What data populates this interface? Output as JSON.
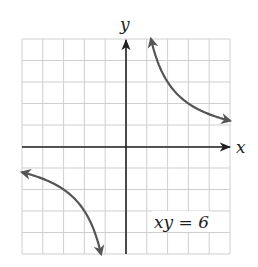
{
  "figure": {
    "equation_label": "xy = 6",
    "x_axis_label": "x",
    "y_axis_label": "y"
  },
  "grid": {
    "x_min": -5,
    "x_max": 5,
    "y_min": -5,
    "y_max": 5,
    "step": 1
  },
  "colors": {
    "grid": "#cfcfcf",
    "axes": "#222222",
    "curve": "#555555",
    "background": "#ffffff"
  },
  "chart_data": {
    "type": "line",
    "title": "",
    "equation": "xy = 6",
    "xlabel": "x",
    "ylabel": "y",
    "xlim": [
      -5,
      5
    ],
    "ylim": [
      -5,
      5
    ],
    "grid": true,
    "series": [
      {
        "name": "upper-branch",
        "x": [
          1.2,
          1.5,
          2,
          2.5,
          3,
          3.5,
          4,
          4.5,
          5
        ],
        "y": [
          5,
          4,
          3,
          2.4,
          2,
          1.714,
          1.5,
          1.333,
          1.2
        ],
        "arrows": "both"
      },
      {
        "name": "lower-branch",
        "x": [
          -5,
          -4.5,
          -4,
          -3.5,
          -3,
          -2.5,
          -2,
          -1.5,
          -1.2
        ],
        "y": [
          -1.2,
          -1.333,
          -1.5,
          -1.714,
          -2,
          -2.4,
          -3,
          -4,
          -5
        ],
        "arrows": "both"
      }
    ]
  }
}
